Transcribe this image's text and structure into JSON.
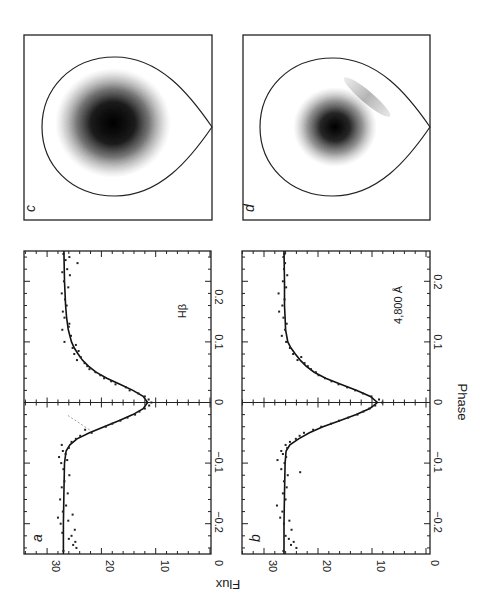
{
  "figure": {
    "orientation": "rotated 90 degrees (landscape figure printed in portrait)",
    "axis_labels": {
      "x": "Phase",
      "y": "Flux"
    },
    "panels": [
      {
        "id": "a",
        "label": "a",
        "annotation": "Hβ"
      },
      {
        "id": "b",
        "label": "b",
        "annotation": "4,800 Å"
      },
      {
        "id": "c",
        "label": "c"
      },
      {
        "id": "d",
        "label": "d"
      }
    ],
    "phase_ticks": [
      "−0.2",
      "−0.1",
      "0",
      "0.1",
      "0.2"
    ],
    "flux_ticks": [
      "0",
      "10",
      "20",
      "30"
    ]
  },
  "chart_data": [
    {
      "type": "line",
      "panel": "a",
      "title": "Hβ",
      "xlabel": "Phase",
      "ylabel": "Flux",
      "xlim": [
        -0.25,
        0.25
      ],
      "ylim": [
        0,
        34
      ],
      "x_ticks": [
        -0.2,
        -0.1,
        0,
        0.1,
        0.2
      ],
      "y_ticks": [
        0,
        10,
        20,
        30
      ],
      "series": [
        {
          "name": "model fit",
          "style": "solid line",
          "x": [
            -0.25,
            -0.2,
            -0.15,
            -0.1,
            -0.08,
            -0.07,
            -0.06,
            -0.05,
            -0.04,
            -0.03,
            -0.02,
            -0.01,
            0,
            0.01,
            0.02,
            0.03,
            0.04,
            0.05,
            0.06,
            0.07,
            0.08,
            0.09,
            0.1,
            0.12,
            0.14,
            0.16,
            0.2,
            0.25
          ],
          "values": [
            27,
            27,
            26.9,
            26.8,
            26.5,
            25.8,
            24.5,
            22.2,
            19.5,
            16.8,
            14.2,
            12.3,
            11.5,
            12.3,
            14.2,
            16.6,
            19,
            21,
            22.4,
            23.5,
            24.3,
            25,
            25.5,
            26.1,
            26.4,
            26.6,
            26.8,
            26.9
          ]
        },
        {
          "name": "observations",
          "style": "points",
          "x": [
            -0.245,
            -0.24,
            -0.235,
            -0.23,
            -0.225,
            -0.22,
            -0.215,
            -0.21,
            -0.2,
            -0.195,
            -0.19,
            -0.185,
            -0.18,
            -0.17,
            -0.16,
            -0.15,
            -0.14,
            -0.13,
            -0.12,
            -0.11,
            -0.1,
            -0.095,
            -0.09,
            -0.085,
            -0.08,
            -0.075,
            -0.07,
            -0.065,
            -0.06,
            -0.055,
            -0.05,
            -0.045,
            -0.04,
            -0.035,
            -0.03,
            -0.025,
            -0.02,
            -0.015,
            -0.01,
            -0.005,
            0,
            0.005,
            0.01,
            0.015,
            0.02,
            0.025,
            0.03,
            0.035,
            0.04,
            0.045,
            0.05,
            0.055,
            0.06,
            0.065,
            0.07,
            0.075,
            0.08,
            0.085,
            0.09,
            0.095,
            0.1,
            0.11,
            0.12,
            0.125,
            0.13,
            0.14,
            0.15,
            0.16,
            0.17,
            0.18,
            0.19,
            0.2,
            0.21,
            0.215,
            0.22,
            0.23,
            0.235,
            0.24,
            0.245
          ],
          "values": [
            27,
            24.6,
            25.2,
            24.8,
            26,
            25.5,
            27.2,
            24.9,
            27.5,
            26.1,
            28,
            25.3,
            27.1,
            26.5,
            27.6,
            26.2,
            27.3,
            26.8,
            25.9,
            27,
            27.4,
            26.3,
            27.8,
            26.6,
            27.1,
            26,
            27.3,
            25.5,
            24.7,
            23.9,
            21.8,
            23,
            19.2,
            18,
            16.5,
            15.2,
            13.8,
            13,
            12,
            11.2,
            10.8,
            11.3,
            12,
            13.2,
            14.8,
            15.5,
            17.4,
            18.2,
            19.5,
            20.2,
            21.1,
            22.2,
            22.6,
            23.1,
            24.5,
            23.8,
            25,
            24.2,
            25.3,
            24.7,
            26.8,
            25.6,
            27.2,
            26,
            25.9,
            26.8,
            27.1,
            26.4,
            26.7,
            27.3,
            26.1,
            26.9,
            25.8,
            27.2,
            26.3,
            24.4,
            26.6,
            25.9,
            27
          ]
        },
        {
          "name": "secondary component",
          "style": "dashed faint",
          "x": [
            -0.045,
            -0.02
          ],
          "values": [
            22.2,
            26.4
          ]
        }
      ]
    },
    {
      "type": "line",
      "panel": "b",
      "title": "4,800 Å",
      "xlabel": "Phase",
      "ylabel": "Flux",
      "xlim": [
        -0.25,
        0.25
      ],
      "ylim": [
        0,
        34
      ],
      "x_ticks": [
        -0.2,
        -0.1,
        0,
        0.1,
        0.2
      ],
      "y_ticks": [
        0,
        10,
        20,
        30
      ],
      "series": [
        {
          "name": "model fit",
          "style": "solid line",
          "x": [
            -0.25,
            -0.2,
            -0.15,
            -0.1,
            -0.08,
            -0.07,
            -0.06,
            -0.05,
            -0.04,
            -0.03,
            -0.02,
            -0.01,
            0,
            0.01,
            0.02,
            0.03,
            0.04,
            0.05,
            0.06,
            0.07,
            0.08,
            0.09,
            0.1,
            0.12,
            0.14,
            0.16,
            0.2,
            0.25
          ],
          "values": [
            26.3,
            26.3,
            26.2,
            26.1,
            25.9,
            25.2,
            23.6,
            21.6,
            19.1,
            16,
            12.9,
            10.4,
            9,
            10.3,
            12.8,
            15.8,
            18.6,
            20.7,
            22.2,
            23.3,
            24.2,
            25,
            25.6,
            26,
            26.1,
            26.2,
            26.2,
            26.3
          ]
        },
        {
          "name": "observations",
          "style": "points",
          "x": [
            -0.245,
            -0.24,
            -0.235,
            -0.23,
            -0.225,
            -0.22,
            -0.21,
            -0.2,
            -0.195,
            -0.19,
            -0.18,
            -0.17,
            -0.16,
            -0.15,
            -0.14,
            -0.13,
            -0.12,
            -0.115,
            -0.11,
            -0.1,
            -0.095,
            -0.09,
            -0.085,
            -0.08,
            -0.075,
            -0.07,
            -0.065,
            -0.06,
            -0.055,
            -0.05,
            -0.045,
            -0.04,
            -0.035,
            -0.03,
            -0.025,
            -0.02,
            -0.015,
            -0.01,
            -0.005,
            0,
            0.005,
            0.01,
            0.015,
            0.02,
            0.025,
            0.03,
            0.035,
            0.04,
            0.045,
            0.05,
            0.055,
            0.06,
            0.065,
            0.07,
            0.075,
            0.08,
            0.09,
            0.1,
            0.11,
            0.12,
            0.13,
            0.14,
            0.15,
            0.16,
            0.17,
            0.18,
            0.19,
            0.2,
            0.21,
            0.22,
            0.23,
            0.24,
            0.245
          ],
          "values": [
            26.4,
            24,
            25,
            24.5,
            25.4,
            26,
            24.9,
            26.3,
            25.3,
            27,
            26.6,
            27.6,
            26,
            26.5,
            25.8,
            26.3,
            25.6,
            23.3,
            26.8,
            26.2,
            27.5,
            25.9,
            26.5,
            26.8,
            25.7,
            26,
            25.2,
            24.1,
            23.4,
            22.6,
            20.9,
            19.4,
            17.6,
            16.1,
            14.4,
            12.7,
            11.6,
            10.5,
            9.4,
            8.1,
            8.7,
            10.1,
            11.7,
            13.1,
            14.6,
            16.2,
            17.5,
            18.7,
            19.9,
            20.4,
            21.3,
            21.9,
            22.5,
            23.8,
            23.1,
            24.6,
            25.2,
            25.9,
            26.7,
            26.1,
            25.8,
            26.4,
            27.2,
            26.6,
            26.2,
            27.3,
            25.9,
            26.5,
            25.7,
            26.3,
            26.1,
            26.4,
            26.2
          ]
        }
      ]
    },
    {
      "type": "heatmap",
      "panel": "c",
      "description": "Roche-lobe outline (teardrop) with a single dark brightness concentration near the lobe centre",
      "features": [
        {
          "kind": "lobe-outline"
        },
        {
          "kind": "blob",
          "cx": 0.45,
          "cy": 0.48,
          "r_core": 0.14,
          "r_halo": 0.28,
          "intensity": 1.0
        }
      ]
    },
    {
      "type": "heatmap",
      "panel": "d",
      "description": "Roche-lobe outline with a smaller central dark concentration and a faint elongated streak toward the upper-right",
      "features": [
        {
          "kind": "lobe-outline"
        },
        {
          "kind": "blob",
          "cx": 0.49,
          "cy": 0.5,
          "r_core": 0.1,
          "r_halo": 0.2,
          "intensity": 1.0
        },
        {
          "kind": "streak",
          "x1": 0.55,
          "y1": 0.24,
          "x2": 0.77,
          "y2": 0.43,
          "intensity": 0.35
        }
      ]
    }
  ]
}
